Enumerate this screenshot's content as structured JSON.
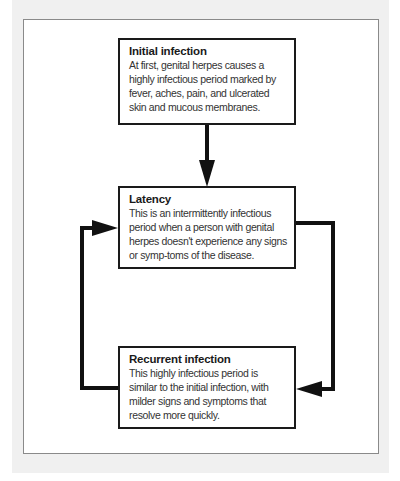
{
  "diagram": {
    "type": "cycle-flowchart",
    "nodes": [
      {
        "id": "initial",
        "title": "Initial infection",
        "body": "At first, genital herpes causes a highly infectious period marked by fever, aches, pain, and ulcerated skin and mucous membranes."
      },
      {
        "id": "latency",
        "title": "Latency",
        "body": "This is an intermittently infectious period when a person with genital herpes doesn't experience any signs or symp-toms of the disease."
      },
      {
        "id": "recurrent",
        "title": "Recurrent infection",
        "body": "This highly infectious period is similar to the initial infection, with milder signs and symptoms that resolve more quickly."
      }
    ],
    "edges": [
      {
        "from": "initial",
        "to": "latency",
        "direction": "down"
      },
      {
        "from": "latency",
        "to": "recurrent",
        "direction": "right-side loop"
      },
      {
        "from": "recurrent",
        "to": "latency",
        "direction": "left-side loop"
      }
    ],
    "colors": {
      "background": "#f0f0f0",
      "panel": "#ffffff",
      "stroke": "#111111",
      "text": "#333333"
    }
  }
}
